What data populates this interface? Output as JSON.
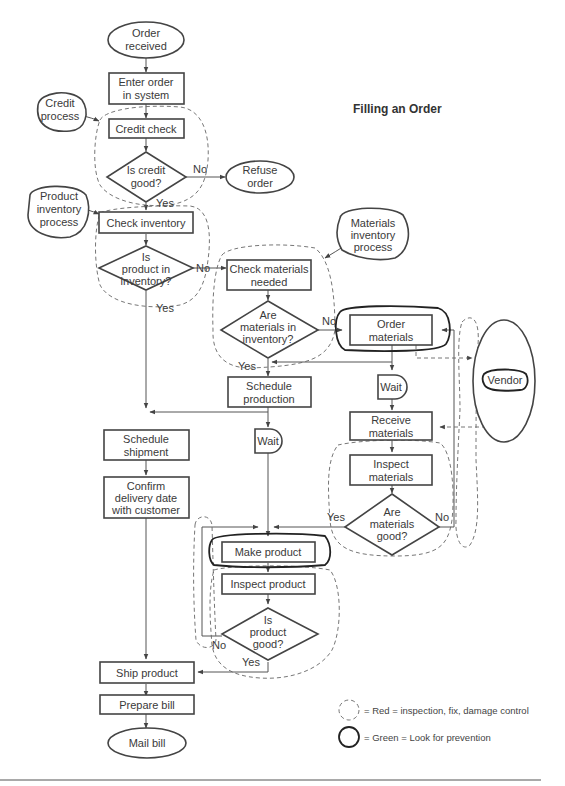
{
  "title": "Filling an Order",
  "nodes": {
    "order_received": [
      "Order",
      "received"
    ],
    "enter_order": [
      "Enter order",
      "in system"
    ],
    "credit_process": [
      "Credit",
      "process"
    ],
    "credit_check": [
      "Credit check"
    ],
    "is_credit_good": [
      "Is credit",
      "good?"
    ],
    "refuse_order": [
      "Refuse",
      "order"
    ],
    "product_inventory_process": [
      "Product",
      "inventory",
      "process"
    ],
    "check_inventory": [
      "Check inventory"
    ],
    "is_product_in_inventory": [
      "Is",
      "product in",
      "inventory?"
    ],
    "materials_inventory_process": [
      "Materials",
      "inventory",
      "process"
    ],
    "check_materials": [
      "Check materials",
      "needed"
    ],
    "are_materials_in_inventory": [
      "Are",
      "materials in",
      "inventory?"
    ],
    "order_materials": [
      "Order",
      "materials"
    ],
    "vendor": [
      "Vendor"
    ],
    "wait_1": [
      "Wait"
    ],
    "schedule_production": [
      "Schedule",
      "production"
    ],
    "receive_materials": [
      "Receive",
      "materials"
    ],
    "wait_2": [
      "Wait"
    ],
    "schedule_shipment": [
      "Schedule",
      "shipment"
    ],
    "inspect_materials": [
      "Inspect",
      "materials"
    ],
    "confirm_delivery": [
      "Confirm",
      "delivery date",
      "with customer"
    ],
    "are_materials_good": [
      "Are",
      "materials",
      "good?"
    ],
    "make_product": [
      "Make product"
    ],
    "inspect_product": [
      "Inspect product"
    ],
    "is_product_good": [
      "Is",
      "product",
      "good?"
    ],
    "ship_product": [
      "Ship product"
    ],
    "prepare_bill": [
      "Prepare bill"
    ],
    "mail_bill": [
      "Mail bill"
    ]
  },
  "edge_labels": {
    "credit_no": "No",
    "credit_yes": "Yes",
    "inventory_no": "No",
    "inventory_yes": "Yes",
    "materials_inv_no": "No",
    "materials_inv_yes": "Yes",
    "materials_good_yes": "Yes",
    "materials_good_no": "No",
    "product_good_no": "No",
    "product_good_yes": "Yes"
  },
  "legend": {
    "dashed": "= Red = inspection, fix, damage control",
    "solid": "= Green = Look for prevention"
  }
}
